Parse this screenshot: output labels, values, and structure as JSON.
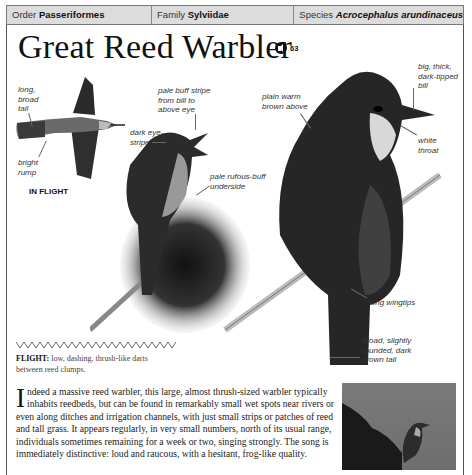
{
  "taxonomy": {
    "order_label": "Order",
    "order_value": "Passeriformes",
    "family_label": "Family",
    "family_value": "Sylviidae",
    "species_label": "Species",
    "species_value": "Acrocephalus arundinaceus"
  },
  "title": "Great Reed Warbler",
  "audio": {
    "icon": "speaker-icon",
    "track_number": "63"
  },
  "flight_illustration": {
    "caption": "IN FLIGHT",
    "labels": [
      "long, broad tail",
      "bright rump"
    ]
  },
  "singing_illustration": {
    "labels": [
      "pale buff stripe from bill to above eye",
      "dark eye-stripe",
      "pale rufous-buff underside"
    ]
  },
  "perched_illustration": {
    "labels": [
      "plain warm brown above",
      "big, thick, dark-tipped bill",
      "white throat",
      "long wingtips",
      "broad, slightly rounded, dark brown tail"
    ]
  },
  "flight": {
    "heading": "FLIGHT:",
    "description": "low, dashing, thrush-like darts between reed clumps."
  },
  "description": {
    "dropcap": "I",
    "text": "ndeed a massive reed warbler, this large, almost thrush-sized warbler typically inhabits reedbeds, but can be found in remarkably small wet spots near rivers or even along ditches and irrigation channels, with just small strips or patches of reed and tall grass. It appears regularly, in very small numbers, north of its usual range, individuals sometimes remaining for a week or two, singing strongly. The song is immediately distinctive: loud and raucous, with a hesitant, frog-like quality."
  },
  "colors": {
    "header_band": "#dcdcdc",
    "frame_border": "#555555",
    "text": "#222222"
  }
}
